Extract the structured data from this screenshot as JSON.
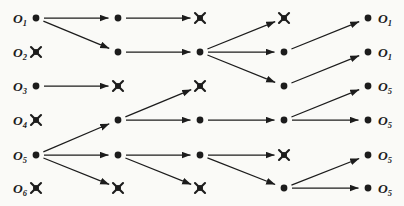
{
  "figure": {
    "background_color": "#fafaf7",
    "ink_color": "#1c1c1c",
    "canvas": {
      "width": 404,
      "height": 206
    },
    "columns_x": [
      36,
      118,
      200,
      284,
      368
    ],
    "rows_y": [
      18,
      52,
      86,
      120,
      155,
      188
    ],
    "left_labels": [
      {
        "base": "O",
        "sub": "1"
      },
      {
        "base": "O",
        "sub": "2"
      },
      {
        "base": "O",
        "sub": "3"
      },
      {
        "base": "O",
        "sub": "4"
      },
      {
        "base": "O",
        "sub": "5"
      },
      {
        "base": "O",
        "sub": "6"
      }
    ],
    "right_labels": [
      {
        "base": "O",
        "sub": "1"
      },
      {
        "base": "O",
        "sub": "1"
      },
      {
        "base": "O",
        "sub": "5"
      },
      {
        "base": "O",
        "sub": "5"
      },
      {
        "base": "O",
        "sub": "5"
      },
      {
        "base": "O",
        "sub": "5"
      }
    ],
    "node_states": [
      [
        "active",
        "pruned",
        "active",
        "pruned",
        "active",
        "pruned"
      ],
      [
        "active",
        "active",
        "pruned",
        "active",
        "active",
        "pruned"
      ],
      [
        "pruned",
        "active",
        "pruned",
        "active",
        "active",
        "pruned"
      ],
      [
        "pruned",
        "active",
        "active",
        "active",
        "pruned",
        "active"
      ],
      [
        "active",
        "active",
        "active",
        "active",
        "active",
        "active"
      ]
    ],
    "edges": [
      {
        "from": [
          0,
          0
        ],
        "to": [
          1,
          0
        ]
      },
      {
        "from": [
          0,
          0
        ],
        "to": [
          1,
          1
        ]
      },
      {
        "from": [
          0,
          2
        ],
        "to": [
          1,
          2
        ]
      },
      {
        "from": [
          0,
          4
        ],
        "to": [
          1,
          3
        ]
      },
      {
        "from": [
          0,
          4
        ],
        "to": [
          1,
          4
        ]
      },
      {
        "from": [
          0,
          4
        ],
        "to": [
          1,
          5
        ]
      },
      {
        "from": [
          1,
          0
        ],
        "to": [
          2,
          0
        ]
      },
      {
        "from": [
          1,
          1
        ],
        "to": [
          2,
          1
        ]
      },
      {
        "from": [
          1,
          3
        ],
        "to": [
          2,
          2
        ]
      },
      {
        "from": [
          1,
          3
        ],
        "to": [
          2,
          3
        ]
      },
      {
        "from": [
          1,
          4
        ],
        "to": [
          2,
          4
        ]
      },
      {
        "from": [
          1,
          4
        ],
        "to": [
          2,
          5
        ]
      },
      {
        "from": [
          2,
          1
        ],
        "to": [
          3,
          0
        ]
      },
      {
        "from": [
          2,
          1
        ],
        "to": [
          3,
          1
        ]
      },
      {
        "from": [
          2,
          1
        ],
        "to": [
          3,
          2
        ]
      },
      {
        "from": [
          2,
          3
        ],
        "to": [
          3,
          3
        ]
      },
      {
        "from": [
          2,
          4
        ],
        "to": [
          3,
          4
        ]
      },
      {
        "from": [
          2,
          4
        ],
        "to": [
          3,
          5
        ]
      },
      {
        "from": [
          3,
          1
        ],
        "to": [
          4,
          0
        ]
      },
      {
        "from": [
          3,
          2
        ],
        "to": [
          4,
          1
        ]
      },
      {
        "from": [
          3,
          3
        ],
        "to": [
          4,
          2
        ]
      },
      {
        "from": [
          3,
          3
        ],
        "to": [
          4,
          3
        ]
      },
      {
        "from": [
          3,
          5
        ],
        "to": [
          4,
          4
        ]
      },
      {
        "from": [
          3,
          5
        ],
        "to": [
          4,
          5
        ]
      }
    ],
    "style": {
      "dot_radius": 3.4,
      "pruned_arm": 5.0,
      "pruned_dot_radius": 3.0,
      "edge_start_gap": 8,
      "edge_end_gap": 9.5
    }
  }
}
